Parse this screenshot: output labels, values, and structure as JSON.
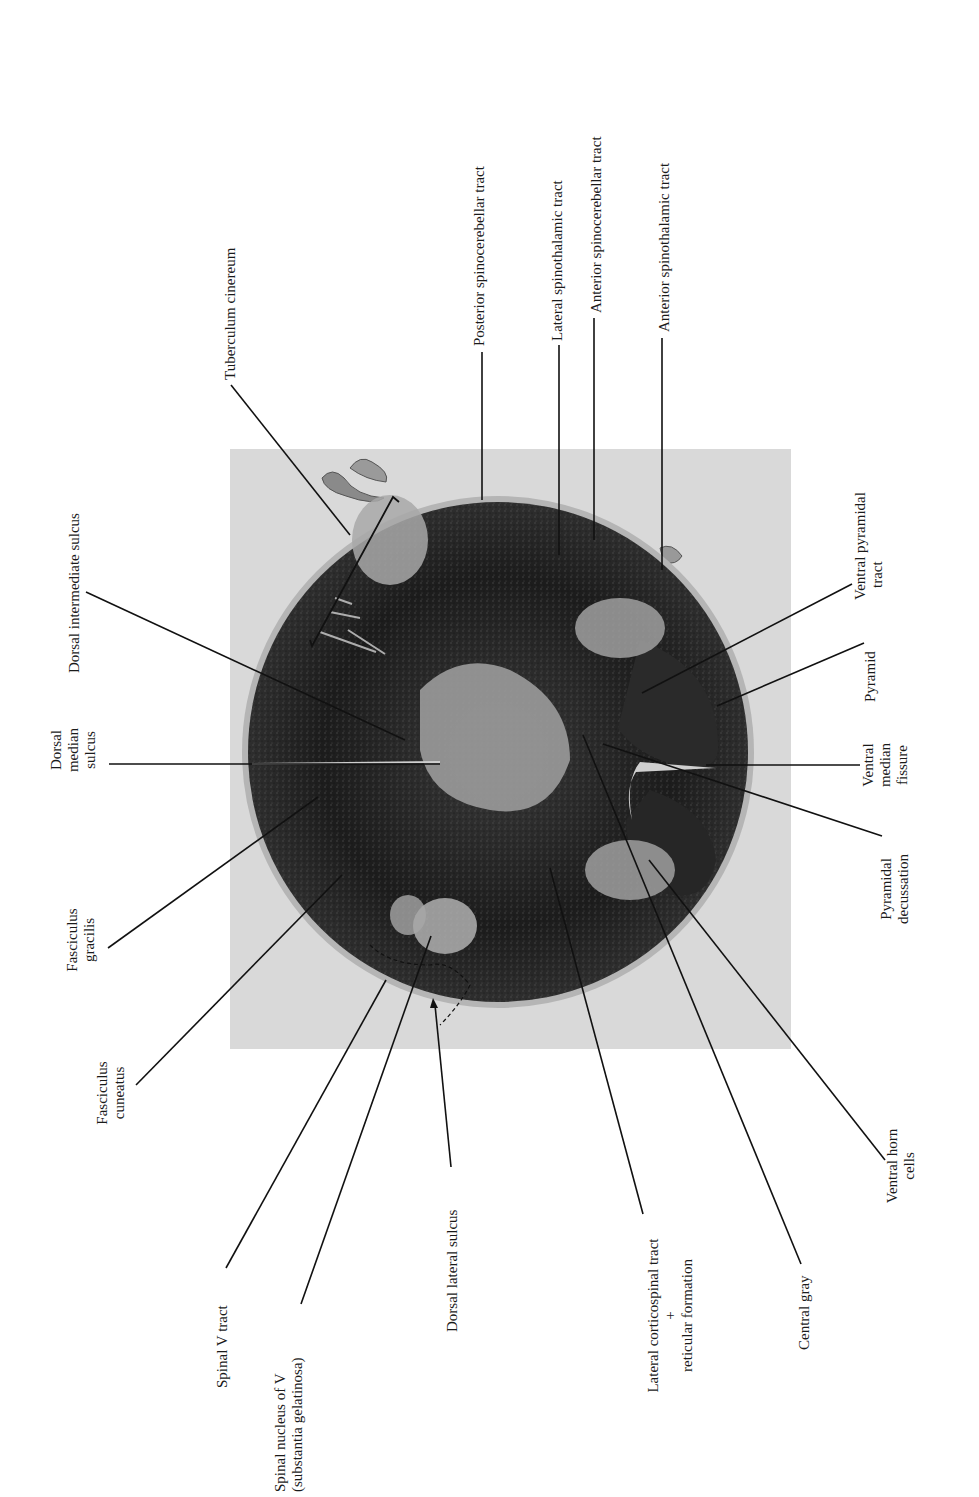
{
  "figure": {
    "photo": {
      "x": 230,
      "y": 449,
      "width": 561,
      "height": 600,
      "bg": "#d8d8d8"
    },
    "section": {
      "cx": 498,
      "cy": 752,
      "rx": 255,
      "ry": 252
    },
    "labels": [
      {
        "id": "tuberculum-cinereum",
        "lines": [
          "Tuberculum cinereum"
        ]
      },
      {
        "id": "posterior-spinocerebellar-tract",
        "lines": [
          "Posterior spinocerebellar tract"
        ]
      },
      {
        "id": "lateral-spinothalamic-tract",
        "lines": [
          "Lateral spinothalamic tract"
        ]
      },
      {
        "id": "anterior-spinocerebellar-tract",
        "lines": [
          "Anterior spinocerebellar tract"
        ]
      },
      {
        "id": "anterior-spinothalamic-tract",
        "lines": [
          "Anterior spinothalamic tract"
        ]
      },
      {
        "id": "dorsal-intermediate-sulcus",
        "lines": [
          "Dorsal intermediate sulcus"
        ]
      },
      {
        "id": "dorsal-median-sulcus",
        "lines": [
          "Dorsal",
          "median",
          "sulcus"
        ]
      },
      {
        "id": "fasciculus-gracilis",
        "lines": [
          "Fasciculus",
          "gracilis"
        ]
      },
      {
        "id": "fasciculus-cuneatus",
        "lines": [
          "Fasciculus",
          "cuneatus"
        ]
      },
      {
        "id": "spinal-v-tract",
        "lines": [
          "Spinal V tract"
        ]
      },
      {
        "id": "spinal-nucleus-of-v",
        "lines": [
          "Spinal nucleus of V",
          "(substantia gelatinosa)"
        ]
      },
      {
        "id": "dorsal-lateral-sulcus",
        "lines": [
          "Dorsal lateral sulcus"
        ]
      },
      {
        "id": "lateral-corticospinal-tract",
        "lines": [
          "Lateral corticospinal tract",
          "+",
          "reticular formation"
        ]
      },
      {
        "id": "central-gray",
        "lines": [
          "Central gray"
        ]
      },
      {
        "id": "ventral-horn-cells",
        "lines": [
          "Ventral horn",
          "cells"
        ]
      },
      {
        "id": "ventral-pyramidal-tract",
        "lines": [
          "Ventral pyramidal",
          "tract"
        ]
      },
      {
        "id": "pyramid",
        "lines": [
          "Pyramid"
        ]
      },
      {
        "id": "ventral-median-fissure",
        "lines": [
          "Ventral",
          "median",
          "fissure"
        ]
      },
      {
        "id": "pyramidal-decussation",
        "lines": [
          "Pyramidal",
          "decussation"
        ]
      }
    ]
  }
}
